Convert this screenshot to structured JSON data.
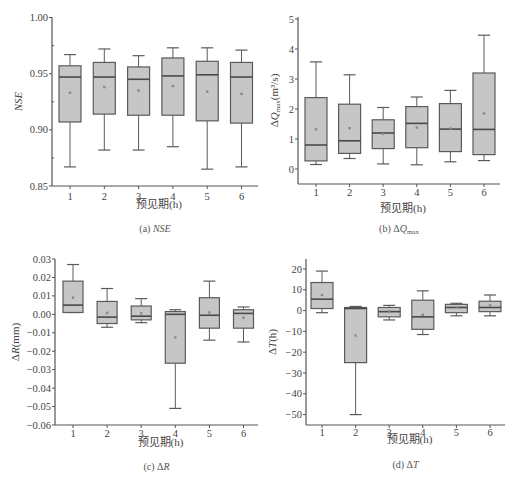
{
  "chart_data": [
    {
      "type": "box",
      "panel": "a",
      "caption_prefix": "(a)",
      "caption": "NSE",
      "ylabel": "NSE",
      "xlabel": "预见期(h)",
      "categories": [
        "1",
        "2",
        "3",
        "4",
        "5",
        "6"
      ],
      "yticks": [
        "0.85",
        "0.90",
        "0.95",
        "1.00"
      ],
      "ylim": [
        0.85,
        1.0
      ],
      "boxes": [
        {
          "min": 0.867,
          "q1": 0.907,
          "median": 0.947,
          "q3": 0.957,
          "max": 0.967,
          "mean": 0.933
        },
        {
          "min": 0.882,
          "q1": 0.914,
          "median": 0.947,
          "q3": 0.96,
          "max": 0.972,
          "mean": 0.938
        },
        {
          "min": 0.882,
          "q1": 0.913,
          "median": 0.945,
          "q3": 0.956,
          "max": 0.966,
          "mean": 0.935
        },
        {
          "min": 0.885,
          "q1": 0.913,
          "median": 0.948,
          "q3": 0.964,
          "max": 0.973,
          "mean": 0.939
        },
        {
          "min": 0.865,
          "q1": 0.908,
          "median": 0.949,
          "q3": 0.961,
          "max": 0.973,
          "mean": 0.934
        },
        {
          "min": 0.867,
          "q1": 0.906,
          "median": 0.947,
          "q3": 0.96,
          "max": 0.971,
          "mean": 0.932
        }
      ]
    },
    {
      "type": "box",
      "panel": "b",
      "caption_prefix": "(b)",
      "caption": "ΔQmax",
      "ylabel": "ΔQmax(m³/s)",
      "xlabel": "预见期(h)",
      "categories": [
        "1",
        "2",
        "3",
        "4",
        "5",
        "6"
      ],
      "yticks": [
        "0",
        "1",
        "2",
        "3",
        "4",
        "5"
      ],
      "ylim": [
        -0.5,
        5
      ],
      "boxes": [
        {
          "min": 0.15,
          "q1": 0.27,
          "median": 0.8,
          "q3": 2.38,
          "max": 3.57,
          "mean": 1.32
        },
        {
          "min": 0.35,
          "q1": 0.52,
          "median": 0.94,
          "q3": 2.16,
          "max": 3.14,
          "mean": 1.36
        },
        {
          "min": 0.17,
          "q1": 0.68,
          "median": 1.2,
          "q3": 1.64,
          "max": 2.05,
          "mean": 1.17
        },
        {
          "min": 0.14,
          "q1": 0.71,
          "median": 1.52,
          "q3": 2.08,
          "max": 2.4,
          "mean": 1.38
        },
        {
          "min": 0.24,
          "q1": 0.58,
          "median": 1.33,
          "q3": 2.18,
          "max": 2.62,
          "mean": 1.35
        },
        {
          "min": 0.28,
          "q1": 0.48,
          "median": 1.32,
          "q3": 3.2,
          "max": 4.46,
          "mean": 1.85
        }
      ]
    },
    {
      "type": "box",
      "panel": "c",
      "caption_prefix": "(c)",
      "caption": "ΔR",
      "ylabel": "ΔR(mm)",
      "xlabel": "预见期(h)",
      "categories": [
        "1",
        "2",
        "3",
        "4",
        "5",
        "6"
      ],
      "yticks": [
        "-0.06",
        "-0.05",
        "-0.04",
        "-0.03",
        "-0.02",
        "-0.01",
        "0.00",
        "0.01",
        "0.02",
        "0.03"
      ],
      "ylim": [
        -0.06,
        0.03
      ],
      "boxes": [
        {
          "min": 0.001,
          "q1": 0.001,
          "median": 0.005,
          "q3": 0.018,
          "max": 0.027,
          "mean": 0.009
        },
        {
          "min": -0.007,
          "q1": -0.005,
          "median": -0.0015,
          "q3": 0.007,
          "max": 0.014,
          "mean": 0.0008
        },
        {
          "min": -0.0045,
          "q1": -0.003,
          "median": -0.001,
          "q3": 0.0045,
          "max": 0.0085,
          "mean": 0.0005
        },
        {
          "min": -0.051,
          "q1": -0.0265,
          "median": 0.0,
          "q3": 0.0015,
          "max": 0.0025,
          "mean": -0.0125
        },
        {
          "min": -0.014,
          "q1": -0.0075,
          "median": -0.0005,
          "q3": 0.009,
          "max": 0.018,
          "mean": 0.001
        },
        {
          "min": -0.015,
          "q1": -0.0075,
          "median": 0.0005,
          "q3": 0.0025,
          "max": 0.004,
          "mean": -0.0018
        }
      ]
    },
    {
      "type": "box",
      "panel": "d",
      "caption_prefix": "(d)",
      "caption": "ΔT",
      "ylabel": "ΔT(h)",
      "xlabel": "预见期(h)",
      "categories": [
        "1",
        "2",
        "3",
        "4",
        "5",
        "6"
      ],
      "yticks": [
        "-50",
        "-40",
        "-30",
        "-20",
        "-10",
        "0",
        "10",
        "20"
      ],
      "ylim": [
        -55,
        25
      ],
      "boxes": [
        {
          "min": -1,
          "q1": 1,
          "median": 5.5,
          "q3": 13.5,
          "max": 19,
          "mean": 7.5
        },
        {
          "min": -50,
          "q1": -25,
          "median": 1,
          "q3": 1.5,
          "max": 2,
          "mean": -12
        },
        {
          "min": -4.5,
          "q1": -3,
          "median": -0.5,
          "q3": 1.5,
          "max": 2.5,
          "mean": -0.3
        },
        {
          "min": -11.5,
          "q1": -9,
          "median": -3,
          "q3": 5,
          "max": 9.5,
          "mean": -2
        },
        {
          "min": -2.5,
          "q1": -1,
          "median": 1.5,
          "q3": 3,
          "max": 3.5,
          "mean": 1.5
        },
        {
          "min": -2.5,
          "q1": -0.5,
          "median": 1.5,
          "q3": 4.5,
          "max": 7.5,
          "mean": 2.5
        }
      ]
    }
  ],
  "style": {
    "box_fill": "#c6c6c6",
    "box_stroke": "#5a5a5a",
    "median_color": "#4a4a4a",
    "axis_color": "#555555",
    "mean_marker": "#888888"
  }
}
